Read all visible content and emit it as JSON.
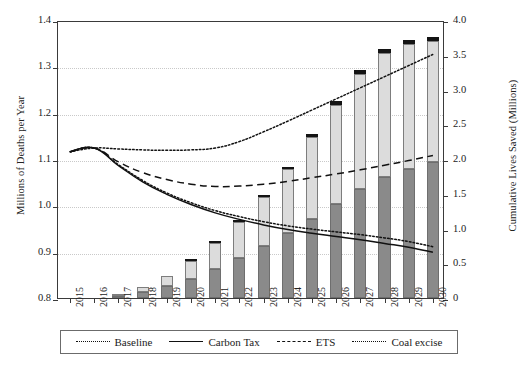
{
  "chart_data": {
    "type": "bar",
    "title": "",
    "subtitle": "",
    "xlabel": "",
    "ylabel": "Millions of Deaths per Year",
    "y2label": "Cumulative Lives Saved (Millions)",
    "grid": true,
    "legend_position": "bottom",
    "categories": [
      "2015",
      "2016",
      "2017",
      "2018",
      "2019",
      "2020",
      "2021",
      "2022",
      "2023",
      "2024",
      "2025",
      "2026",
      "2027",
      "2028",
      "2029",
      "2030"
    ],
    "ylim": [
      0.8,
      1.4
    ],
    "yticks": [
      "0.8",
      "0.9",
      "1.0",
      "1.1",
      "1.2",
      "1.3",
      "1.4"
    ],
    "y2lim": [
      0,
      4.0
    ],
    "y2ticks": [
      "0",
      "0.5",
      "1.0",
      "1.5",
      "2.0",
      "2.5",
      "3.0",
      "3.5",
      "4.0"
    ],
    "bar_axis": "right",
    "stacked_series": [
      {
        "name": "carbon-tax-lives-saved",
        "color": "#8a8a8a",
        "values": [
          0,
          0,
          0.03,
          0.08,
          0.17,
          0.28,
          0.42,
          0.58,
          0.75,
          0.93,
          1.14,
          1.35,
          1.57,
          1.74,
          1.85,
          1.95
        ]
      },
      {
        "name": "ets-lives-saved",
        "color": "#dcdcdc",
        "values": [
          0,
          0,
          0.03,
          0.08,
          0.15,
          0.25,
          0.37,
          0.52,
          0.7,
          0.92,
          1.17,
          1.43,
          1.65,
          1.79,
          1.8,
          1.75
        ]
      },
      {
        "name": "coal-excise-lives-saved",
        "color": "#141414",
        "values": [
          0,
          0,
          0.0,
          0.0,
          0.0,
          0.01,
          0.01,
          0.02,
          0.03,
          0.04,
          0.05,
          0.05,
          0.06,
          0.06,
          0.06,
          0.06
        ]
      }
    ],
    "bar_totals": [
      0,
      0,
      0.06,
      0.16,
      0.32,
      0.54,
      0.8,
      1.12,
      1.48,
      1.89,
      2.36,
      2.83,
      3.28,
      3.59,
      3.71,
      3.76
    ],
    "series": [
      {
        "name": "Baseline",
        "style": "dotted",
        "axis": "left",
        "values": [
          1.12,
          1.128,
          1.126,
          1.124,
          1.123,
          1.124,
          1.128,
          1.142,
          1.163,
          1.186,
          1.21,
          1.234,
          1.258,
          1.282,
          1.306,
          1.33
        ]
      },
      {
        "name": "Carbon Tax",
        "style": "solid",
        "axis": "left",
        "values": [
          1.12,
          1.128,
          1.09,
          1.055,
          1.028,
          1.006,
          0.988,
          0.974,
          0.962,
          0.952,
          0.944,
          0.937,
          0.93,
          0.922,
          0.914,
          0.903
        ]
      },
      {
        "name": "ETS",
        "style": "dashed",
        "axis": "left",
        "values": [
          1.12,
          1.128,
          1.098,
          1.075,
          1.06,
          1.05,
          1.045,
          1.046,
          1.05,
          1.056,
          1.064,
          1.072,
          1.081,
          1.091,
          1.101,
          1.112
        ]
      },
      {
        "name": "Coal excise",
        "style": "dotted",
        "axis": "left",
        "values": [
          1.12,
          1.128,
          1.092,
          1.058,
          1.031,
          1.01,
          0.993,
          0.98,
          0.969,
          0.96,
          0.953,
          0.947,
          0.941,
          0.934,
          0.926,
          0.915
        ]
      }
    ]
  },
  "legend": {
    "items": [
      {
        "label": "Baseline",
        "style": "dotted"
      },
      {
        "label": "Carbon Tax",
        "style": "solid"
      },
      {
        "label": "ETS",
        "style": "dashed"
      },
      {
        "label": "Coal excise",
        "style": "dotted"
      }
    ]
  },
  "colors": {
    "segment_1": "#8a8a8a",
    "segment_2": "#dcdcdc",
    "segment_3": "#141414",
    "axis": "#3a3a3a",
    "grid": "#c9c9c9"
  }
}
